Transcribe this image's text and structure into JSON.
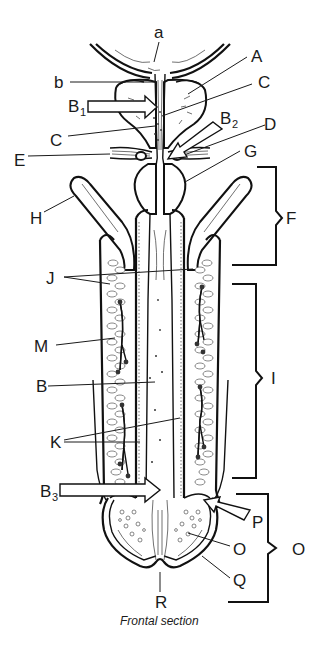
{
  "diagram": {
    "caption": "Frontal section",
    "labels": {
      "a": "a",
      "A": "A",
      "b": "b",
      "B1": "B",
      "B1_sub": "1",
      "C1": "C",
      "B2": "B",
      "B2_sub": "2",
      "C2": "C",
      "D": "D",
      "E": "E",
      "G": "G",
      "H": "H",
      "F": "F",
      "J": "J",
      "M": "M",
      "I": "I",
      "B": "B",
      "K": "K",
      "B3": "B",
      "B3_sub": "3",
      "P": "P",
      "O_inner": "O",
      "O_bracket": "O",
      "Q": "Q",
      "R": "R"
    }
  }
}
